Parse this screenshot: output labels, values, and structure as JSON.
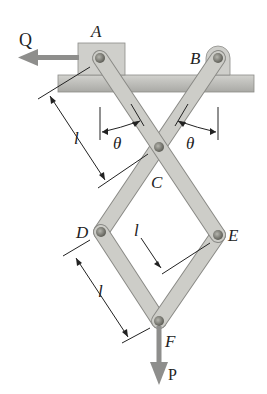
{
  "diagram": {
    "type": "mechanism",
    "labels": {
      "A": "A",
      "B": "B",
      "C": "C",
      "D": "D",
      "E": "E",
      "F": "F",
      "theta_left": "θ",
      "theta_right": "θ",
      "len_upper": "l",
      "len_middle": "l",
      "len_lower": "l"
    },
    "forces": {
      "Q": {
        "label": "Q",
        "direction": "left"
      },
      "P": {
        "label": "P",
        "direction": "down"
      }
    },
    "colors": {
      "member": "#c9c9c4",
      "member_edge": "#8a8a86",
      "ground": "#bdbdb8",
      "force_arrow": "#8e8e8c",
      "pin": "#777770"
    }
  }
}
